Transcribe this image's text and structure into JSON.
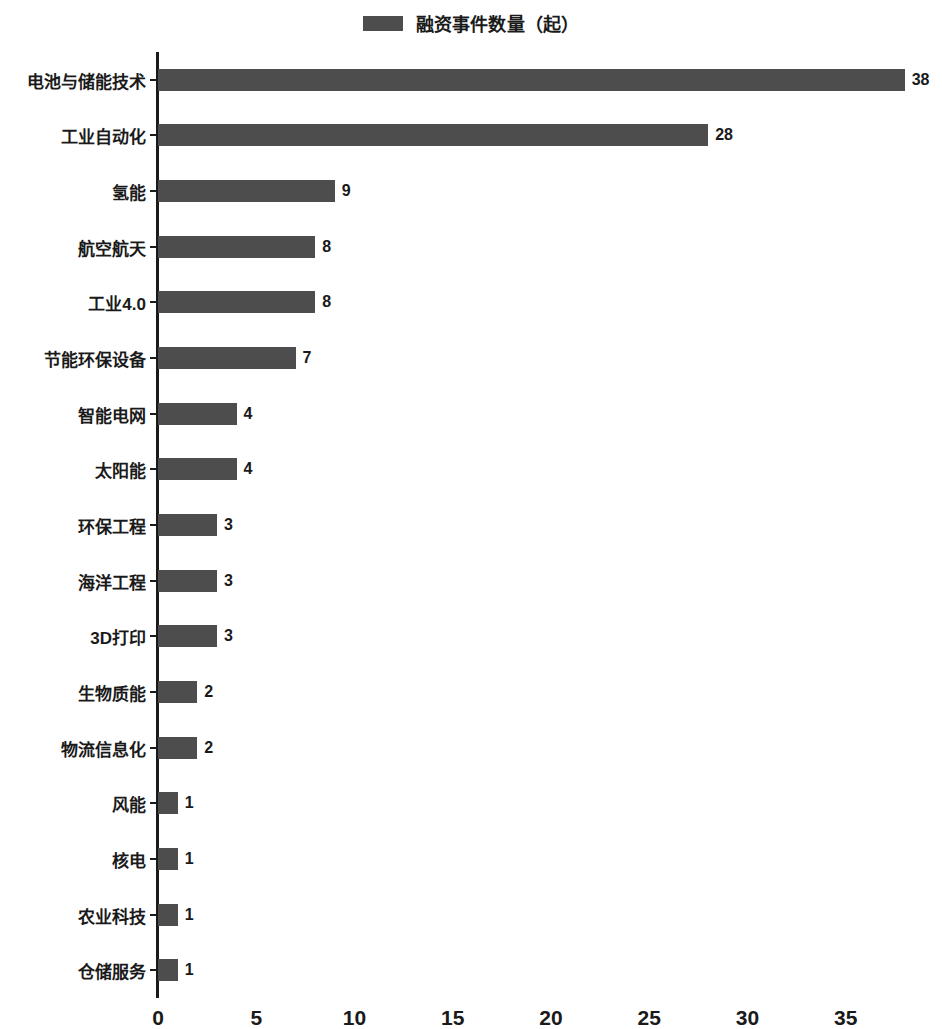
{
  "legend": {
    "items": [
      {
        "label": "融资事件数量（起）",
        "color": "#4d4d4d",
        "swatch_name": "legend-color-swatch"
      }
    ]
  },
  "chart_data": {
    "type": "bar",
    "orientation": "horizontal",
    "title": "",
    "subtitle": "",
    "xlabel": "",
    "ylabel": "",
    "grid": false,
    "legend_position": "top-center",
    "series_name": "融资事件数量（起）",
    "series_color": "#4d4d4d",
    "xlim": [
      0,
      39.9
    ],
    "xticks": [
      0,
      5,
      10,
      15,
      20,
      25,
      30,
      35
    ],
    "xtick_labels": [
      "0",
      "5",
      "10",
      "15",
      "20",
      "25",
      "30",
      "35"
    ],
    "categories": [
      "电池与储能技术",
      "工业自动化",
      "氢能",
      "航空航天",
      "工业4.0",
      "节能环保设备",
      "智能电网",
      "太阳能",
      "环保工程",
      "海洋工程",
      "3D打印",
      "生物质能",
      "物流信息化",
      "风能",
      "核电",
      "农业科技",
      "仓储服务"
    ],
    "values": [
      38,
      28,
      9,
      8,
      8,
      7,
      4,
      4,
      3,
      3,
      3,
      2,
      2,
      1,
      1,
      1,
      1
    ],
    "value_labels": [
      "38",
      "28",
      "9",
      "8",
      "8",
      "7",
      "4",
      "4",
      "3",
      "3",
      "3",
      "2",
      "2",
      "1",
      "1",
      "1",
      "1"
    ]
  }
}
